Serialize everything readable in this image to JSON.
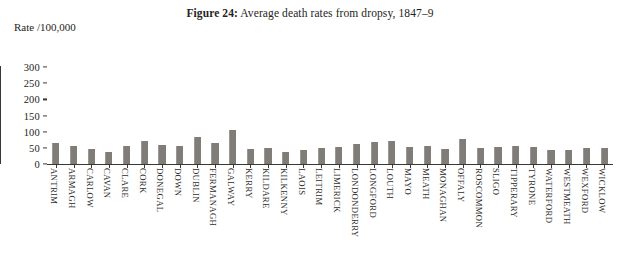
{
  "figure": {
    "number_label": "Figure 24:",
    "caption": "Average death rates from dropsy, 1847–9",
    "y_axis_caption": "Rate /100,000"
  },
  "colors": {
    "bar": "#807d79",
    "axis": "#3b3834",
    "text": "#262421",
    "background": "#ffffff"
  },
  "chart_data": {
    "type": "bar",
    "title": "Figure 24: Average death rates from dropsy, 1847–9",
    "xlabel": "",
    "ylabel": "Rate /100,000",
    "ylim": [
      0,
      300
    ],
    "yticks": [
      0,
      50,
      100,
      150,
      200,
      250,
      300
    ],
    "grid": false,
    "legend": "none",
    "categories": [
      "ANTRIM",
      "ARMAGH",
      "CARLOW",
      "CAVAN",
      "CLARE",
      "CORK",
      "DONEGAL",
      "DOWN",
      "DUBLIN",
      "FERMANAGH",
      "GALWAY",
      "KERRY",
      "KILDARE",
      "KILKENNY",
      "LAOIS",
      "LEITRIM",
      "LIMERICK",
      "LONDONDERRY",
      "LONGFORD",
      "LOUTH",
      "MAYO",
      "MEATH",
      "MONAGHAN",
      "OFFALY",
      "ROSCOMMON",
      "SLIGO",
      "TIPPERARY",
      "TYRONE",
      "WATERFORD",
      "WESTMEATH",
      "WEXFORD",
      "WICKLOW"
    ],
    "values": [
      66,
      56,
      45,
      38,
      57,
      72,
      59,
      56,
      85,
      66,
      105,
      47,
      48,
      38,
      44,
      50,
      54,
      61,
      68,
      70,
      52,
      56,
      46,
      77,
      49,
      54,
      57,
      53,
      42,
      43,
      51,
      50
    ]
  }
}
